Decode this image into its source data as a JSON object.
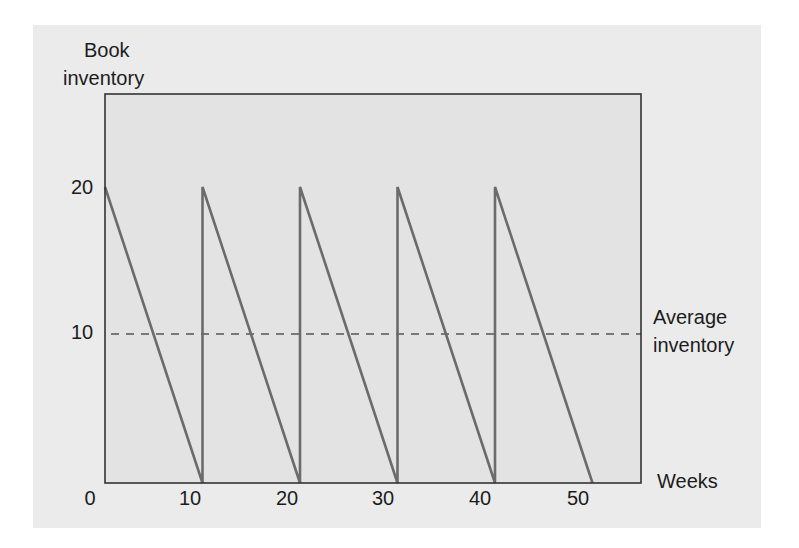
{
  "chart_data": {
    "type": "line",
    "title": "",
    "ylabel": "Book inventory",
    "xlabel": "Weeks",
    "x_ticks": [
      "0",
      "10",
      "20",
      "30",
      "40",
      "50"
    ],
    "y_ticks": [
      "0",
      "10",
      "20"
    ],
    "xlim": [
      0,
      55
    ],
    "ylim": [
      0,
      23
    ],
    "grid": false,
    "series": [
      {
        "name": "Inventory level",
        "x": [
          0,
          10,
          10,
          20,
          20,
          30,
          30,
          40,
          40,
          50
        ],
        "values": [
          20,
          0,
          20,
          0,
          20,
          0,
          20,
          0,
          20,
          0
        ]
      }
    ],
    "annotations": [
      {
        "type": "hline",
        "y": 10,
        "style": "dashed",
        "label": "Average inventory"
      }
    ]
  },
  "labels": {
    "y_title_line1": "Book",
    "y_title_line2": "inventory",
    "avg_line1": "Average",
    "avg_line2": "inventory",
    "x_title": "Weeks"
  },
  "colors": {
    "panel_bg": "#ebebeb",
    "plot_bg": "#e3e3e3",
    "frame": "#333333",
    "series": "#6b6b6b",
    "dash": "#555555"
  }
}
